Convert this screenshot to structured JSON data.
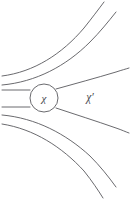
{
  "figure": {
    "type": "field-line-diagram",
    "width": 131,
    "height": 200,
    "background_color": "#ffffff",
    "line_color": "#59595e",
    "label_color": "#4a4a50"
  },
  "vertex": {
    "label": "χ",
    "shape": "circle",
    "center_x": 44,
    "center_y": 98,
    "radius": 14,
    "fill_color": "#ffffff",
    "stroke_color": "#59595e"
  },
  "region": {
    "label": "χ′",
    "label_x": 90,
    "label_y": 98
  },
  "lines": {
    "incoming": [
      {
        "name": "incoming-line-upper",
        "d": "M 2 90 L 30 90"
      },
      {
        "name": "incoming-line-lower",
        "d": "M 2 107 L 30 107"
      }
    ],
    "curves": [
      {
        "name": "field-line-top-outer",
        "d": "M 2 76 C 34 72 62 54 84 28 C 92 18 98 10 104 2"
      },
      {
        "name": "field-line-top-inner",
        "d": "M 2 85 C 36 82 66 66 90 42 C 100 32 108 22 116 12"
      },
      {
        "name": "field-line-upper-near",
        "d": "M 56 89 C 74 84 96 78 116 72 C 122 70 126 69 129 68"
      },
      {
        "name": "field-line-lower-near",
        "d": "M 56 108 C 74 114 96 121 116 128 C 122 130 126 132 129 133"
      },
      {
        "name": "field-line-bottom-inner",
        "d": "M 2 115 C 36 118 66 134 90 156 C 100 166 108 176 116 187"
      },
      {
        "name": "field-line-bottom-outer",
        "d": "M 2 124 C 34 129 62 147 84 171 C 92 181 98 190 103 198"
      }
    ]
  }
}
